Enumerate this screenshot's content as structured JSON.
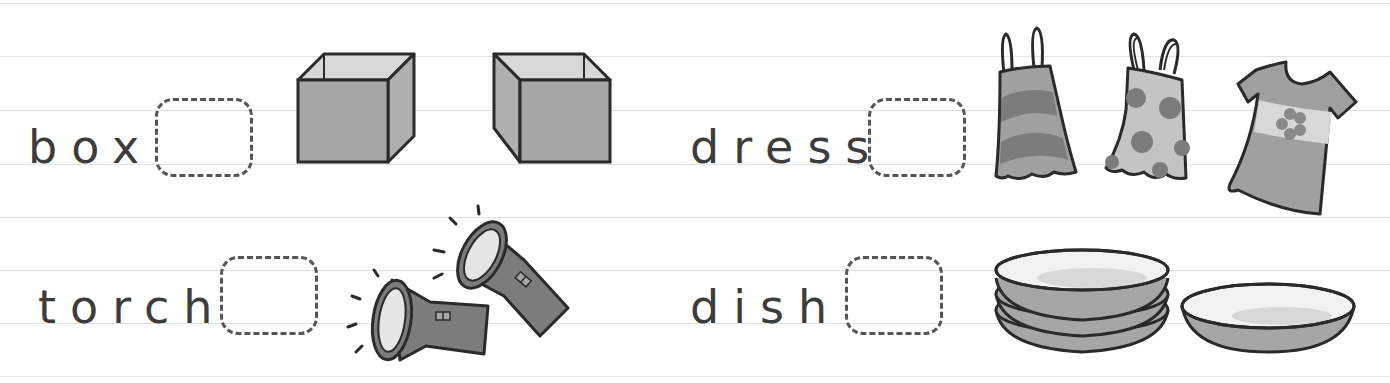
{
  "worksheet": {
    "rules_y": [
      3,
      56,
      110,
      164,
      217,
      270,
      323,
      376
    ],
    "colors": {
      "text": "#3c3c3c",
      "outline": "#2a2a2a",
      "fill_mid": "#a6a6a6",
      "fill_dark": "#7c7c7c",
      "fill_light": "#d8d8d8",
      "fill_lighter": "#ededed",
      "rule": "#e2e2e2",
      "dash": "#555555"
    },
    "items": [
      {
        "word": "box",
        "pictures": [
          "box-icon",
          "box-icon"
        ]
      },
      {
        "word": "dress",
        "pictures": [
          "striped-dress-icon",
          "spotted-dress-icon",
          "flower-dress-icon"
        ]
      },
      {
        "word": "torch",
        "pictures": [
          "torch-icon",
          "torch-icon"
        ]
      },
      {
        "word": "dish",
        "pictures": [
          "stacked-dishes-icon",
          "dish-icon"
        ]
      }
    ]
  }
}
